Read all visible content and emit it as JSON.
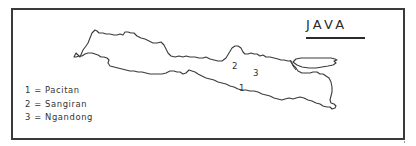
{
  "map": {
    "title": "JAVA",
    "legend": [
      {
        "number": "1",
        "separator": "=",
        "site": "Pacitan",
        "text": "1 = Pacitan"
      },
      {
        "number": "2",
        "separator": "=",
        "site": "Sangiran",
        "text": "2 = Sangiran"
      },
      {
        "number": "3",
        "separator": "=",
        "site": "Ngandong",
        "text": "3 = Ngandong"
      }
    ],
    "markers": [
      {
        "label": "1",
        "x": 239,
        "y": 83
      },
      {
        "label": "2",
        "x": 232,
        "y": 61
      },
      {
        "label": "3",
        "x": 253,
        "y": 68
      }
    ],
    "colors": {
      "line": "#3a3a3a",
      "text": "#2b2b2b",
      "background": "#ffffff"
    }
  }
}
